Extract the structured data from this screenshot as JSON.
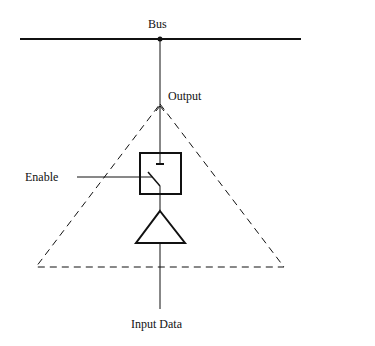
{
  "diagram": {
    "type": "tri-state buffer connected to bus",
    "labels": {
      "bus": "Bus",
      "output": "Output",
      "enable": "Enable",
      "input": "Input Data"
    },
    "components": [
      {
        "id": "bus",
        "kind": "line",
        "label": "Bus"
      },
      {
        "id": "switch",
        "kind": "switch-box",
        "controlled_by": "Enable"
      },
      {
        "id": "buffer",
        "kind": "triangle-buffer"
      },
      {
        "id": "boundary",
        "kind": "dashed-triangle"
      }
    ],
    "connections": [
      [
        "Input Data",
        "buffer"
      ],
      [
        "buffer",
        "switch"
      ],
      [
        "Enable",
        "switch"
      ],
      [
        "switch",
        "Output"
      ],
      [
        "Output",
        "bus"
      ]
    ],
    "colors": {
      "stroke": "#111111",
      "background": "#ffffff"
    }
  }
}
